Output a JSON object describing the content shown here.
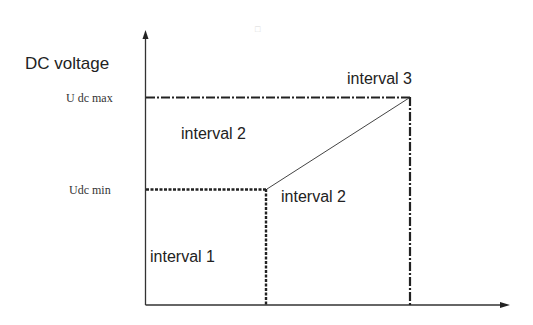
{
  "diagram": {
    "y_axis_label": "DC voltage",
    "levels": [
      {
        "id": "udc_max",
        "label": "U dc max"
      },
      {
        "id": "udc_min",
        "label": "Udc min"
      }
    ],
    "regions": [
      {
        "id": "interval1",
        "label": "interval 1"
      },
      {
        "id": "interval2_upper",
        "label": "interval 2"
      },
      {
        "id": "interval2_lower",
        "label": "interval 2"
      },
      {
        "id": "interval3",
        "label": "interval 3"
      }
    ],
    "artifact_mark": "□"
  }
}
